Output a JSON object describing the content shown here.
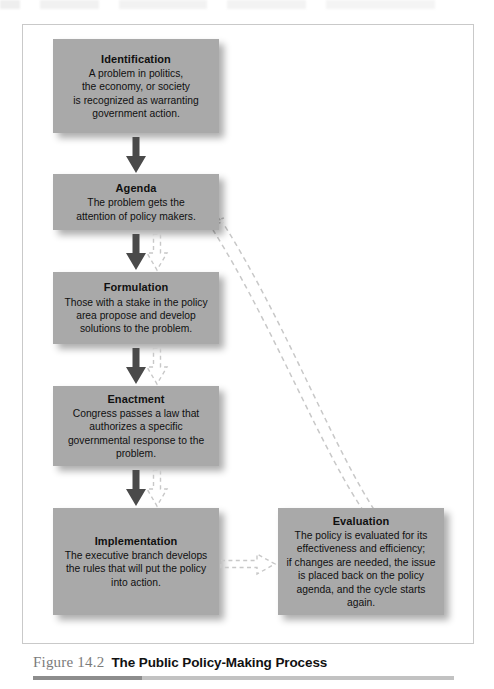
{
  "figure": {
    "number_label": "Figure 14.2",
    "title": "The Public Policy-Making Process"
  },
  "colors": {
    "box_fill": "#a9a9a9",
    "box_text": "#101010",
    "solid_arrow": "#4a4a4a",
    "dashed_arrow": "#c8c8c8",
    "frame_border": "#c9c9c9",
    "caption_number": "#7b7b7b",
    "caption_title": "#111111",
    "rule_dark": "#8d8d8d",
    "rule_light": "#c2c2c2"
  },
  "diagram": {
    "type": "flowchart",
    "stages": [
      {
        "id": "identification",
        "title": "Identification",
        "lines": [
          "A problem in politics,",
          "the economy, or society",
          "is recognized as warranting",
          "government action."
        ]
      },
      {
        "id": "agenda",
        "title": "Agenda",
        "lines": [
          "The problem gets the",
          "attention of policy makers."
        ]
      },
      {
        "id": "formulation",
        "title": "Formulation",
        "lines": [
          "Those with a stake in the policy",
          "area propose and develop",
          "solutions to the problem."
        ]
      },
      {
        "id": "enactment",
        "title": "Enactment",
        "lines": [
          "Congress passes a law that",
          "authorizes a specific",
          "governmental response to the",
          "problem."
        ]
      },
      {
        "id": "implementation",
        "title": "Implementation",
        "lines": [
          "The executive branch develops",
          "the rules that will put the policy",
          "into action."
        ]
      },
      {
        "id": "evaluation",
        "title": "Evaluation",
        "lines": [
          "The policy is evaluated for its",
          "effectiveness and efficiency;",
          "if changes are needed, the issue",
          "is placed back on the policy",
          "agenda, and the cycle starts",
          "again."
        ]
      }
    ],
    "connectors": [
      {
        "id": "identification-to-agenda",
        "style": "solid",
        "direction": "down"
      },
      {
        "id": "agenda-to-formulation",
        "style": "solid",
        "direction": "down"
      },
      {
        "id": "formulation-to-enactment",
        "style": "solid",
        "direction": "down"
      },
      {
        "id": "enactment-to-implementation",
        "style": "solid",
        "direction": "down"
      },
      {
        "id": "feedback-agenda-down",
        "style": "dashed",
        "direction": "down"
      },
      {
        "id": "feedback-formulation-down",
        "style": "dashed",
        "direction": "down"
      },
      {
        "id": "feedback-enactment-down",
        "style": "dashed",
        "direction": "down"
      },
      {
        "id": "implementation-to-evaluation",
        "style": "dashed",
        "direction": "right"
      },
      {
        "id": "evaluation-to-agenda-loop",
        "style": "dashed",
        "direction": "up-left"
      }
    ]
  }
}
